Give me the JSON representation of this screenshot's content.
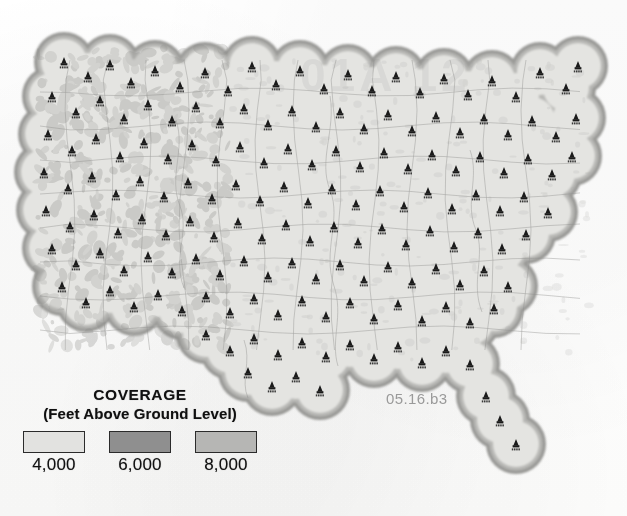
{
  "document": {
    "type": "coverage-map",
    "region": "Continental United States",
    "figure_id": "05.16.b3",
    "ghost_watermark": "01A 12"
  },
  "legend": {
    "title": "COVERAGE",
    "subtitle": "(Feet Above Ground Level)",
    "items": [
      {
        "label": "4,000",
        "color": "#e2e2e0",
        "name": "coverage-4000"
      },
      {
        "label": "6,000",
        "color": "#8f8f8f",
        "name": "coverage-6000"
      },
      {
        "label": "8,000",
        "color": "#b6b6b4",
        "name": "coverage-8000"
      }
    ]
  },
  "map": {
    "background": "#ffffff",
    "fill_inner": "#e4e4e1",
    "fill_mid": "#b8b8b5",
    "fill_outer": "#9a9a97",
    "border_color": "#8d8d8a",
    "tower_color": "#1a1a1a",
    "tower_count": 152,
    "tower_label_sample": "KXXX",
    "note": "Overlapping circular coverage contours centered on broadcast tower sites; three grayscale elevation bands."
  },
  "chart_data": {
    "type": "map",
    "title": "COVERAGE",
    "subtitle": "(Feet Above Ground Level)",
    "legend_entries": [
      "4,000",
      "6,000",
      "8,000"
    ],
    "series": [
      {
        "name": "4,000",
        "value": 4000,
        "unit": "feet above ground level",
        "color": "#e2e2e0"
      },
      {
        "name": "6,000",
        "value": 6000,
        "unit": "feet above ground level",
        "color": "#8f8f8f"
      },
      {
        "name": "8,000",
        "value": 8000,
        "unit": "feet above ground level",
        "color": "#b6b6b4"
      }
    ],
    "towers": [
      [
        64,
        62
      ],
      [
        88,
        76
      ],
      [
        110,
        64
      ],
      [
        131,
        82
      ],
      [
        155,
        70
      ],
      [
        180,
        86
      ],
      [
        205,
        72
      ],
      [
        228,
        90
      ],
      [
        252,
        66
      ],
      [
        276,
        84
      ],
      [
        300,
        70
      ],
      [
        324,
        88
      ],
      [
        348,
        74
      ],
      [
        372,
        90
      ],
      [
        396,
        76
      ],
      [
        420,
        92
      ],
      [
        444,
        78
      ],
      [
        468,
        94
      ],
      [
        492,
        80
      ],
      [
        516,
        96
      ],
      [
        540,
        72
      ],
      [
        566,
        88
      ],
      [
        578,
        66
      ],
      [
        52,
        96
      ],
      [
        76,
        112
      ],
      [
        100,
        100
      ],
      [
        124,
        118
      ],
      [
        148,
        104
      ],
      [
        172,
        120
      ],
      [
        196,
        106
      ],
      [
        220,
        122
      ],
      [
        244,
        108
      ],
      [
        268,
        124
      ],
      [
        292,
        110
      ],
      [
        316,
        126
      ],
      [
        340,
        112
      ],
      [
        364,
        128
      ],
      [
        388,
        114
      ],
      [
        412,
        130
      ],
      [
        436,
        116
      ],
      [
        460,
        132
      ],
      [
        484,
        118
      ],
      [
        508,
        134
      ],
      [
        532,
        120
      ],
      [
        556,
        136
      ],
      [
        576,
        118
      ],
      [
        48,
        134
      ],
      [
        72,
        150
      ],
      [
        96,
        138
      ],
      [
        120,
        156
      ],
      [
        144,
        142
      ],
      [
        168,
        158
      ],
      [
        192,
        144
      ],
      [
        216,
        160
      ],
      [
        240,
        146
      ],
      [
        264,
        162
      ],
      [
        288,
        148
      ],
      [
        312,
        164
      ],
      [
        336,
        150
      ],
      [
        360,
        166
      ],
      [
        384,
        152
      ],
      [
        408,
        168
      ],
      [
        432,
        154
      ],
      [
        456,
        170
      ],
      [
        480,
        156
      ],
      [
        504,
        172
      ],
      [
        528,
        158
      ],
      [
        552,
        174
      ],
      [
        572,
        156
      ],
      [
        44,
        172
      ],
      [
        68,
        188
      ],
      [
        92,
        176
      ],
      [
        116,
        194
      ],
      [
        140,
        180
      ],
      [
        164,
        196
      ],
      [
        188,
        182
      ],
      [
        212,
        198
      ],
      [
        236,
        184
      ],
      [
        260,
        200
      ],
      [
        284,
        186
      ],
      [
        308,
        202
      ],
      [
        332,
        188
      ],
      [
        356,
        204
      ],
      [
        380,
        190
      ],
      [
        404,
        206
      ],
      [
        428,
        192
      ],
      [
        452,
        208
      ],
      [
        476,
        194
      ],
      [
        500,
        210
      ],
      [
        524,
        196
      ],
      [
        548,
        212
      ],
      [
        46,
        210
      ],
      [
        70,
        226
      ],
      [
        94,
        214
      ],
      [
        118,
        232
      ],
      [
        142,
        218
      ],
      [
        166,
        234
      ],
      [
        190,
        220
      ],
      [
        214,
        236
      ],
      [
        238,
        222
      ],
      [
        262,
        238
      ],
      [
        286,
        224
      ],
      [
        310,
        240
      ],
      [
        334,
        226
      ],
      [
        358,
        242
      ],
      [
        382,
        228
      ],
      [
        406,
        244
      ],
      [
        430,
        230
      ],
      [
        454,
        246
      ],
      [
        478,
        232
      ],
      [
        502,
        248
      ],
      [
        526,
        234
      ],
      [
        52,
        248
      ],
      [
        76,
        264
      ],
      [
        100,
        252
      ],
      [
        124,
        270
      ],
      [
        148,
        256
      ],
      [
        172,
        272
      ],
      [
        196,
        258
      ],
      [
        220,
        274
      ],
      [
        244,
        260
      ],
      [
        268,
        276
      ],
      [
        292,
        262
      ],
      [
        316,
        278
      ],
      [
        340,
        264
      ],
      [
        364,
        280
      ],
      [
        388,
        266
      ],
      [
        412,
        282
      ],
      [
        436,
        268
      ],
      [
        460,
        284
      ],
      [
        484,
        270
      ],
      [
        508,
        286
      ],
      [
        62,
        286
      ],
      [
        86,
        302
      ],
      [
        110,
        290
      ],
      [
        134,
        306
      ],
      [
        158,
        294
      ],
      [
        182,
        310
      ],
      [
        206,
        296
      ],
      [
        230,
        312
      ],
      [
        254,
        298
      ],
      [
        278,
        314
      ],
      [
        302,
        300
      ],
      [
        326,
        316
      ],
      [
        350,
        302
      ],
      [
        374,
        318
      ],
      [
        398,
        304
      ],
      [
        422,
        320
      ],
      [
        446,
        306
      ],
      [
        470,
        322
      ],
      [
        494,
        308
      ],
      [
        206,
        334
      ],
      [
        230,
        350
      ],
      [
        254,
        338
      ],
      [
        278,
        354
      ],
      [
        302,
        342
      ],
      [
        326,
        356
      ],
      [
        350,
        344
      ],
      [
        374,
        358
      ],
      [
        398,
        346
      ],
      [
        422,
        362
      ],
      [
        446,
        350
      ],
      [
        470,
        364
      ],
      [
        248,
        372
      ],
      [
        272,
        386
      ],
      [
        296,
        376
      ],
      [
        320,
        390
      ],
      [
        486,
        396
      ],
      [
        500,
        420
      ],
      [
        516,
        444
      ]
    ],
    "grid": false,
    "legend_position": "bottom-left"
  }
}
